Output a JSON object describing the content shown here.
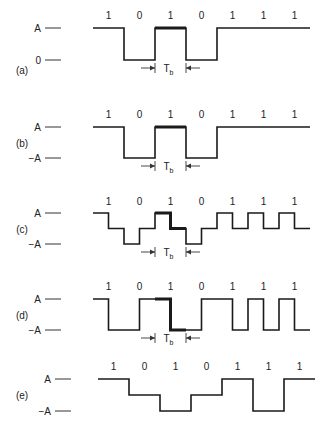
{
  "bits": [
    "1",
    "0",
    "1",
    "0",
    "1",
    "1",
    "1"
  ],
  "tb_label": "T",
  "tb_sub": "b",
  "panels": [
    {
      "id": "a",
      "label": "(a)",
      "levels": [
        "A",
        "0"
      ],
      "halfbit_levels": [
        1,
        1,
        0,
        0,
        1,
        1,
        0,
        0,
        1,
        1,
        1,
        1,
        1,
        1
      ],
      "highlight_bit": 2,
      "tb_marker": true
    },
    {
      "id": "b",
      "label": "(b)",
      "levels": [
        "A",
        "-A"
      ],
      "halfbit_levels": [
        1,
        1,
        -1,
        -1,
        1,
        1,
        -1,
        -1,
        1,
        1,
        1,
        1,
        1,
        1
      ],
      "highlight_bit": 2,
      "tb_marker": true
    },
    {
      "id": "c",
      "label": "(c)",
      "levels": [
        "A",
        "-A"
      ],
      "halfbit_levels": [
        1,
        0,
        -1,
        0,
        1,
        0,
        -1,
        0,
        1,
        0,
        1,
        0,
        1,
        0
      ],
      "highlight_bit": 2,
      "tb_marker": true
    },
    {
      "id": "d",
      "label": "(d)",
      "levels": [
        "A",
        "-A"
      ],
      "halfbit_levels": [
        1,
        -1,
        -1,
        1,
        1,
        -1,
        -1,
        1,
        1,
        -1,
        1,
        -1,
        1,
        -1
      ],
      "highlight_bit": 2,
      "tb_marker": true
    },
    {
      "id": "e",
      "label": "(e)",
      "levels": [
        "A",
        "-A"
      ],
      "halfbit_levels": [
        1,
        1,
        0,
        0,
        -1,
        -1,
        0,
        0,
        1,
        1,
        -1,
        -1,
        1,
        1
      ],
      "highlight_bit": null,
      "tb_marker": false
    }
  ]
}
